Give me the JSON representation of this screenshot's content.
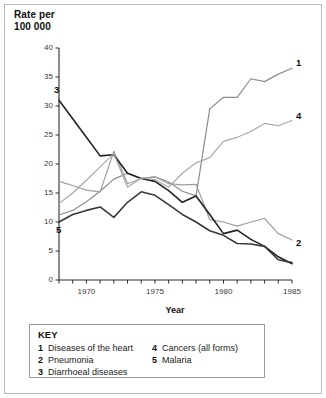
{
  "chart_data": {
    "type": "line",
    "title": "",
    "ylabel": "Rate per\n100 000",
    "xlabel": "Year",
    "xlim": [
      1968,
      1985
    ],
    "ylim": [
      0,
      40
    ],
    "ytick_step": 5,
    "yticks": [
      "0",
      "5",
      "10",
      "15",
      "20",
      "25",
      "30",
      "35",
      "40"
    ],
    "xticks_labeled": [
      "1970",
      "1975",
      "1980",
      "1985"
    ],
    "xtick_every": 1,
    "grid": false,
    "legend_position": "below-plot",
    "x": [
      1968,
      1969,
      1970,
      1971,
      1972,
      1973,
      1974,
      1975,
      1976,
      1977,
      1978,
      1979,
      1980,
      1981,
      1982,
      1983,
      1984,
      1985
    ],
    "series": [
      {
        "name": "Diseases of the heart",
        "key": "1",
        "color": "#8c8c8c",
        "end_label": "1",
        "values": [
          11.2,
          12.0,
          13.5,
          15.3,
          17.4,
          18.4,
          17.5,
          17.8,
          16.9,
          15.3,
          14.5,
          29.5,
          31.5,
          31.5,
          34.7,
          34.2,
          35.5,
          36.5
        ]
      },
      {
        "name": "Pneumonia",
        "key": "2",
        "color": "#9e9e9e",
        "end_label": "2",
        "values": [
          17.0,
          16.3,
          15.5,
          15.2,
          22.2,
          16.6,
          17.5,
          17.8,
          16.6,
          16.4,
          16.5,
          10.4,
          10.0,
          9.3,
          10.0,
          10.6,
          8.0,
          6.9
        ]
      },
      {
        "name": "Diarrhoeal diseases",
        "key": "3",
        "color": "#222222",
        "end_label": "3",
        "values": [
          31.0,
          27.8,
          24.6,
          21.4,
          21.6,
          18.4,
          17.5,
          17.0,
          15.4,
          13.4,
          14.5,
          11.3,
          8.0,
          8.6,
          7.0,
          5.8,
          4.0,
          2.8
        ]
      },
      {
        "name": "Cancers (all forms)",
        "key": "4",
        "color": "#a8a8a8",
        "end_label": "4",
        "values": [
          13.2,
          15.0,
          17.2,
          19.5,
          21.8,
          16.0,
          17.6,
          17.3,
          16.0,
          18.4,
          20.2,
          21.1,
          23.9,
          24.6,
          25.6,
          27.0,
          26.6,
          27.5
        ]
      },
      {
        "name": "Malaria",
        "key": "5",
        "color": "#3a3a3a",
        "end_label": "5",
        "values": [
          10.0,
          11.3,
          12.0,
          12.6,
          10.8,
          13.4,
          15.2,
          14.6,
          13.0,
          11.3,
          10.0,
          8.5,
          7.7,
          6.3,
          6.2,
          5.8,
          3.5,
          3.0
        ]
      }
    ]
  },
  "legend": {
    "title": "KEY",
    "column_a": [
      {
        "num": "1",
        "label": "Diseases of the heart"
      },
      {
        "num": "2",
        "label": "Pneumonia"
      },
      {
        "num": "3",
        "label": "Diarrhoeal diseases"
      }
    ],
    "column_b": [
      {
        "num": "4",
        "label": "Cancers (all forms)"
      },
      {
        "num": "5",
        "label": "Malaria"
      }
    ]
  },
  "axis": {
    "y_title_line1": "Rate per",
    "y_title_line2": "100 000",
    "x_title": "Year"
  },
  "end_labels": {
    "top_right_1": "1",
    "mid_right_4": "4",
    "low_right_2": "2",
    "top_left_3": "3",
    "low_left_5": "5"
  },
  "colors": {
    "frame": "#b9b9b9",
    "axis": "#2b2b2b",
    "text": "#111111"
  }
}
